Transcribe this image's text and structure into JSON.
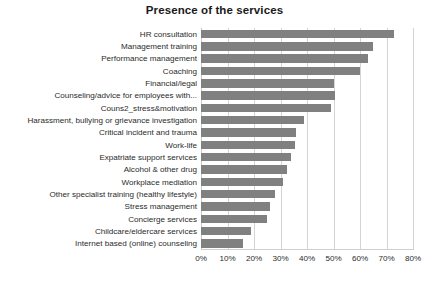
{
  "chart_data": {
    "type": "bar",
    "orientation": "horizontal",
    "title": "Presence of the services",
    "xlabel": "",
    "ylabel": "",
    "xlim": [
      0,
      80
    ],
    "xtick_labels": [
      "0%",
      "10%",
      "20%",
      "30%",
      "40%",
      "50%",
      "60%",
      "70%",
      "80%"
    ],
    "xtick_values": [
      0,
      10,
      20,
      30,
      40,
      50,
      60,
      70,
      80
    ],
    "grid": "vertical",
    "legend": "none",
    "value_unit": "%",
    "bar_color": "#808080",
    "categories": [
      "HR consultation",
      "Management training",
      "Performance management",
      "Coaching",
      "Financial/legal",
      "Counseling/advice for employees with...",
      "Couns2_stress&motivation",
      "Harassment, bullying or grievance investigation",
      "Critical incident and trauma",
      "Work-life",
      "Expatriate support services",
      "Alcohol & other drug",
      "Workplace mediation",
      "Other specialist training (healthy lifestyle)",
      "Stress management",
      "Concierge services",
      "Childcare/eldercare services",
      "Internet based (online) counseling"
    ],
    "values": [
      73,
      65,
      63,
      60,
      50,
      50.5,
      49,
      39,
      36,
      35.5,
      34,
      32.5,
      31,
      28,
      26,
      25,
      19,
      16
    ]
  }
}
